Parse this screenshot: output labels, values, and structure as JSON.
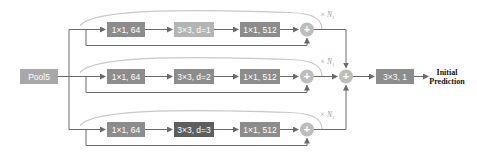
{
  "diagram": {
    "input": {
      "label": "Pool5",
      "color": "#a8a8a8"
    },
    "branches": [
      {
        "blocks": [
          {
            "label": "1×1, 64",
            "color": "#8c8c8c"
          },
          {
            "label": "3×3, d=1",
            "color": "#b4b4b4"
          },
          {
            "label": "1×1, 512",
            "color": "#8c8c8c"
          }
        ],
        "repeat_label": "× N",
        "repeat_sub": "1"
      },
      {
        "blocks": [
          {
            "label": "1×1, 64",
            "color": "#8c8c8c"
          },
          {
            "label": "3×3, d=2",
            "color": "#8c8c8c"
          },
          {
            "label": "1×1, 512",
            "color": "#8c8c8c"
          }
        ],
        "repeat_label": "× N",
        "repeat_sub": "1"
      },
      {
        "blocks": [
          {
            "label": "1×1, 64",
            "color": "#8c8c8c"
          },
          {
            "label": "3×3, d=3",
            "color": "#5e5e5e"
          },
          {
            "label": "1×1, 512",
            "color": "#8c8c8c"
          }
        ],
        "repeat_label": "× N",
        "repeat_sub": "1"
      }
    ],
    "sum_symbol": "+",
    "final_block": {
      "label": "3×3, 1",
      "color": "#8c8c8c"
    },
    "output_line1": "Initial",
    "output_line2": "Prediction",
    "line_color": "#6a6a6a",
    "arc_color": "#c8c8c8",
    "circle_color": "#bdbdbd"
  }
}
